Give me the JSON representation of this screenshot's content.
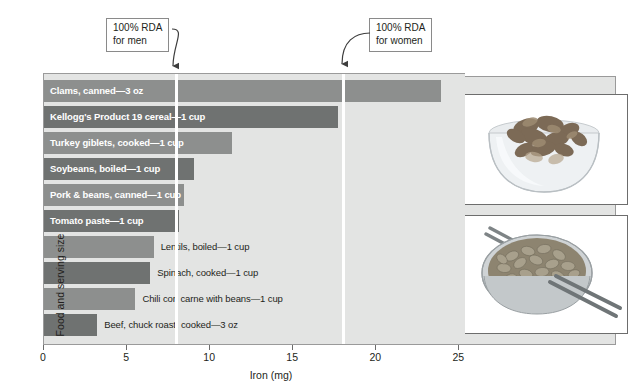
{
  "chart_data": {
    "type": "bar",
    "orientation": "horizontal",
    "title": "",
    "xlabel": "Iron (mg)",
    "ylabel": "Food and serving size",
    "xlim": [
      0,
      25.4
    ],
    "xticks": [
      0,
      5,
      10,
      15,
      20,
      25
    ],
    "xticklabels": [
      "0",
      "5",
      "10",
      "15",
      "20",
      "25"
    ],
    "grid": false,
    "legend": null,
    "categories": [
      "Clams, canned—3 oz",
      "Kellogg's Product 19 cereal—1 cup",
      "Turkey giblets, cooked—1 cup",
      "Soybeans, boiled—1 cup",
      "Pork & beans, canned—1 cup",
      "Tomato paste—1 cup",
      "Lentils, boiled—1 cup",
      "Spinach, cooked—1 cup",
      "Chili con carne with beans—1 cup",
      "Beef, chuck roast, cooked—3 oz"
    ],
    "values": [
      23.9,
      17.7,
      11.3,
      9.0,
      8.4,
      8.1,
      6.6,
      6.4,
      5.5,
      3.2
    ],
    "bars": [
      {
        "label": "Clams, canned—3 oz",
        "value": 23.9,
        "shade": "light",
        "label_inside": true
      },
      {
        "label": "Kellogg's Product 19 cereal—1 cup",
        "value": 17.7,
        "shade": "dark",
        "label_inside": true
      },
      {
        "label": "Turkey giblets, cooked—1 cup",
        "value": 11.3,
        "shade": "light",
        "label_inside": true
      },
      {
        "label": "Soybeans, boiled—1 cup",
        "value": 9.0,
        "shade": "dark",
        "label_inside": true
      },
      {
        "label": "Pork & beans, canned—1 cup",
        "value": 8.4,
        "shade": "light",
        "label_inside": true
      },
      {
        "label": "Tomato paste—1 cup",
        "value": 8.1,
        "shade": "dark",
        "label_inside": true
      },
      {
        "label": "Lentils, boiled—1 cup",
        "value": 6.6,
        "shade": "light",
        "label_inside": false
      },
      {
        "label": "Spinach, cooked—1 cup",
        "value": 6.4,
        "shade": "dark",
        "label_inside": false
      },
      {
        "label": "Chili con carne with beans—1 cup",
        "value": 5.5,
        "shade": "light",
        "label_inside": false
      },
      {
        "label": "Beef, chuck roast, cooked—3 oz",
        "value": 3.2,
        "shade": "dark",
        "label_inside": false
      }
    ],
    "reference_lines": [
      {
        "name": "rda-men",
        "value": 8,
        "annotation": "100% RDA\nfor men",
        "annotation_line1": "100% RDA",
        "annotation_line2": "for men",
        "color": "#ffffff"
      },
      {
        "name": "rda-women",
        "value": 18,
        "annotation": "100% RDA\nfor women",
        "annotation_line1": "100% RDA",
        "annotation_line2": "for women",
        "color": "#ffffff"
      }
    ],
    "colors": {
      "bar_light": "#8d8f8e",
      "bar_dark": "#6f7271",
      "plot_background": "#e3e4e3",
      "reference_line": "#ffffff",
      "text": "#231f20"
    }
  },
  "annotations": {
    "men": {
      "line1": "100% RDA",
      "line2": "for men"
    },
    "women": {
      "line1": "100% RDA",
      "line2": "for women"
    }
  },
  "axes": {
    "x_title": "Iron (mg)",
    "y_title": "Food and serving size",
    "x_tick_labels": [
      "0",
      "5",
      "10",
      "15",
      "20",
      "25"
    ]
  },
  "photos": [
    {
      "name": "cereal-bowl-photo",
      "alt": "Bowl of breakfast cereal flakes"
    },
    {
      "name": "beans-bowl-photo",
      "alt": "Bowl of beans with chopsticks"
    }
  ]
}
